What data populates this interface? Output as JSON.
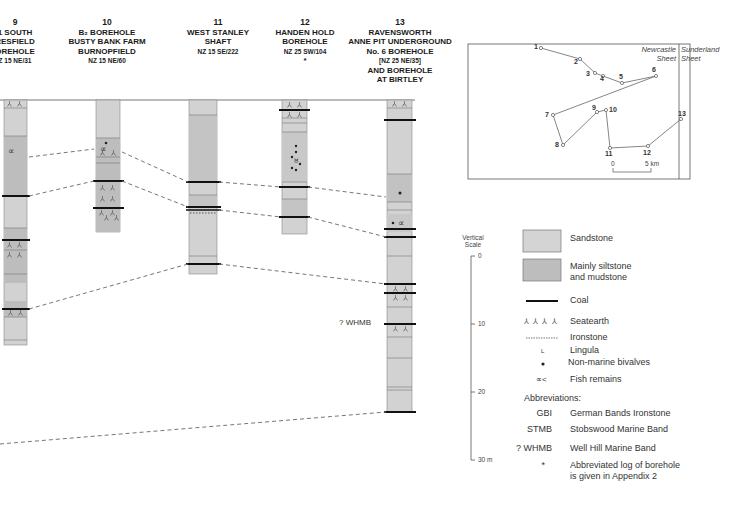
{
  "page_header": "",
  "boreholes": [
    {
      "id": "9",
      "number": "9",
      "lines": [
        "1 SOUTH",
        "RESFIELD",
        "OREHOLE"
      ],
      "ref": "Z 15 NE/31"
    },
    {
      "id": "10",
      "number": "10",
      "lines": [
        "B₂ BOREHOLE",
        "BUSTY BANK FARM",
        "BURNOPFIELD"
      ],
      "ref": "NZ 15 NE/60"
    },
    {
      "id": "11",
      "number": "11",
      "lines": [
        "WEST STANLEY",
        "SHAFT"
      ],
      "ref": "NZ 15 SE/222"
    },
    {
      "id": "12",
      "number": "12",
      "lines": [
        "HANDEN HOLD",
        "BOREHOLE"
      ],
      "ref": "NZ 25 SW/104",
      "note": "*"
    },
    {
      "id": "13",
      "number": "13",
      "lines": [
        "RAVENSWORTH",
        "ANNE PIT UNDERGROUND",
        "No. 6 BOREHOLE"
      ],
      "ref": "[NZ 25 NE/35]",
      "extra": [
        "AND BOREHOLE",
        "AT BIRTLEY"
      ]
    }
  ],
  "annotations": {
    "whmb": "? WHMB"
  },
  "map": {
    "sheet_left": "Newcastle Sheet",
    "sheet_left_l1": "Newcastle",
    "sheet_left_l2": "Sheet",
    "sheet_right_l1": "Sunderland",
    "sheet_right_l2": "Sheet",
    "scale_start": "0",
    "scale_end": "5 km",
    "points": [
      {
        "n": "1",
        "x": 539,
        "y": 48
      },
      {
        "n": "2",
        "x": 580,
        "y": 59
      },
      {
        "n": "3",
        "x": 595,
        "y": 73
      },
      {
        "n": "4",
        "x": 603,
        "y": 76
      },
      {
        "n": "5",
        "x": 622,
        "y": 83
      },
      {
        "n": "6",
        "x": 656,
        "y": 76
      },
      {
        "n": "7",
        "x": 553,
        "y": 115
      },
      {
        "n": "8",
        "x": 563,
        "y": 145
      },
      {
        "n": "9",
        "x": 597,
        "y": 112
      },
      {
        "n": "10",
        "x": 606,
        "y": 110
      },
      {
        "n": "11",
        "x": 610,
        "y": 148
      },
      {
        "n": "12",
        "x": 648,
        "y": 146
      },
      {
        "n": "13",
        "x": 681,
        "y": 119
      }
    ]
  },
  "vertical_scale": {
    "title_l1": "Vertical",
    "title_l2": "Scale",
    "ticks": [
      "0",
      "10",
      "20",
      "30 m"
    ]
  },
  "legend": {
    "sandstone": "Sandstone",
    "siltstone_l1": "Mainly siltstone",
    "siltstone_l2": "and mudstone",
    "coal": "Coal",
    "seatearth": "Seatearth",
    "seatearth_symbol": "⅄ ⅄ ⅄ ⅄",
    "ironstone": "Ironstone",
    "lingula": "Lingula",
    "lingula_symbol": "L",
    "bivalves": "Non-marine bivalves",
    "fish": "Fish remains",
    "fish_symbol": "∝<",
    "abbrev_title": "Abbreviations:",
    "abbreviations": [
      {
        "code": "GBI",
        "meaning": "German Bands Ironstone"
      },
      {
        "code": "STMB",
        "meaning": "Stobswood Marine Band"
      },
      {
        "code": "? WHMB",
        "meaning": "Well Hill Marine Band"
      },
      {
        "code": "*",
        "meaning": "Abbreviated log  of borehole"
      }
    ],
    "asterisk_l2": "is given in Appendix 2"
  },
  "colors": {
    "sandstone": "#d4d4d4",
    "siltstone": "#bdbdbd",
    "coal": "#111111",
    "dash": "#777777"
  }
}
